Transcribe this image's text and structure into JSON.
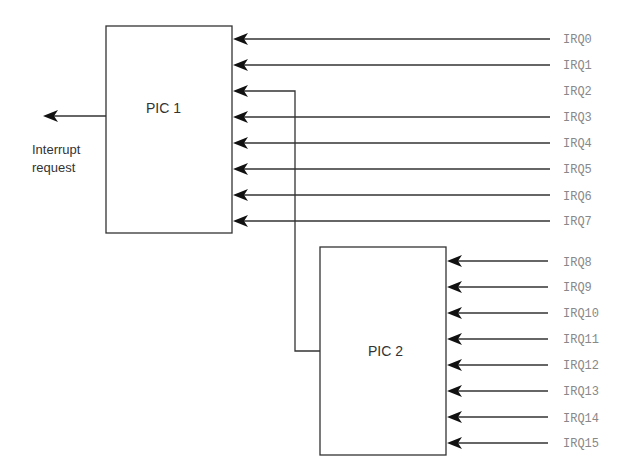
{
  "diagram": {
    "pic1": {
      "label": "PIC 1"
    },
    "pic2": {
      "label": "PIC 2"
    },
    "output": {
      "line1": "Interrupt",
      "line2": "request"
    },
    "pic1_inputs": [
      "IRQ0",
      "IRQ1",
      "IRQ2",
      "IRQ3",
      "IRQ4",
      "IRQ5",
      "IRQ6",
      "IRQ7"
    ],
    "pic2_inputs": [
      "IRQ8",
      "IRQ9",
      "IRQ10",
      "IRQ11",
      "IRQ12",
      "IRQ13",
      "IRQ14",
      "IRQ15"
    ],
    "cascade": {
      "from": "PIC 2",
      "to_input": "IRQ2"
    }
  }
}
